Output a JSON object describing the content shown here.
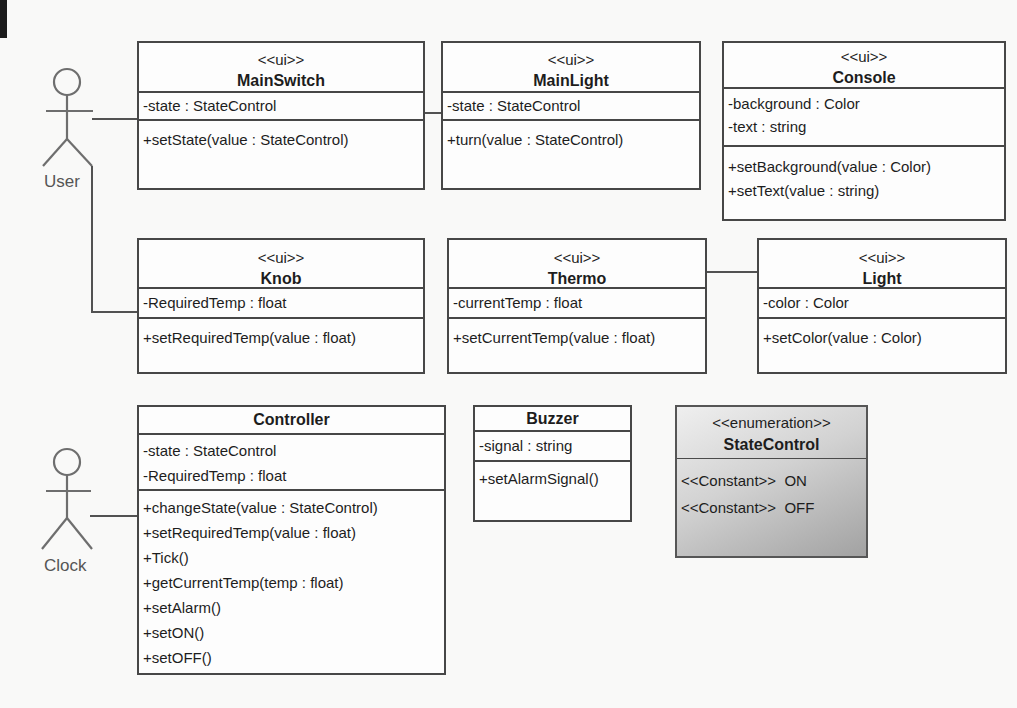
{
  "diagram": {
    "kind": "UML class diagram",
    "colors": {
      "box_border": "#474747",
      "box_fill": "#fdfdfd",
      "text": "#1d1d1d",
      "actor_stroke": "#6e6e6e",
      "enum_gradient_top": "#efefef",
      "enum_gradient_bottom": "#a2a2a2",
      "page_background": "#f9f9f8"
    }
  },
  "actors": {
    "user": {
      "label": "User"
    },
    "clock": {
      "label": "Clock"
    }
  },
  "classes": {
    "mainswitch": {
      "stereotype": "<<ui>>",
      "name": "MainSwitch",
      "attributes": [
        "-state : StateControl"
      ],
      "methods": [
        "+setState(value : StateControl)"
      ]
    },
    "mainlight": {
      "stereotype": "<<ui>>",
      "name": "MainLight",
      "attributes": [
        "-state : StateControl"
      ],
      "methods": [
        "+turn(value : StateControl)"
      ]
    },
    "console": {
      "stereotype": "<<ui>>",
      "name": "Console",
      "attributes": [
        "-background : Color",
        "-text : string"
      ],
      "methods": [
        "+setBackground(value : Color)",
        "+setText(value : string)"
      ]
    },
    "knob": {
      "stereotype": "<<ui>>",
      "name": "Knob",
      "attributes": [
        "-RequiredTemp : float"
      ],
      "methods": [
        "+setRequiredTemp(value : float)"
      ]
    },
    "thermo": {
      "stereotype": "<<ui>>",
      "name": "Thermo",
      "attributes": [
        "-currentTemp : float"
      ],
      "methods": [
        "+setCurrentTemp(value : float)"
      ]
    },
    "light": {
      "stereotype": "<<ui>>",
      "name": "Light",
      "attributes": [
        "-color : Color"
      ],
      "methods": [
        "+setColor(value : Color)"
      ]
    },
    "controller": {
      "name": "Controller",
      "attributes": [
        "-state : StateControl",
        "-RequiredTemp : float"
      ],
      "methods": [
        "+changeState(value : StateControl)",
        "+setRequiredTemp(value : float)",
        "+Tick()",
        "+getCurrentTemp(temp : float)",
        "+setAlarm()",
        "+setON()",
        "+setOFF()"
      ]
    },
    "buzzer": {
      "name": "Buzzer",
      "attributes": [
        "-signal : string"
      ],
      "methods": [
        "+setAlarmSignal()"
      ]
    },
    "statecontrol": {
      "stereotype": "<<enumeration>>",
      "name": "StateControl",
      "constants": [
        "<<Constant>>  ON",
        "<<Constant>>  OFF"
      ]
    }
  }
}
